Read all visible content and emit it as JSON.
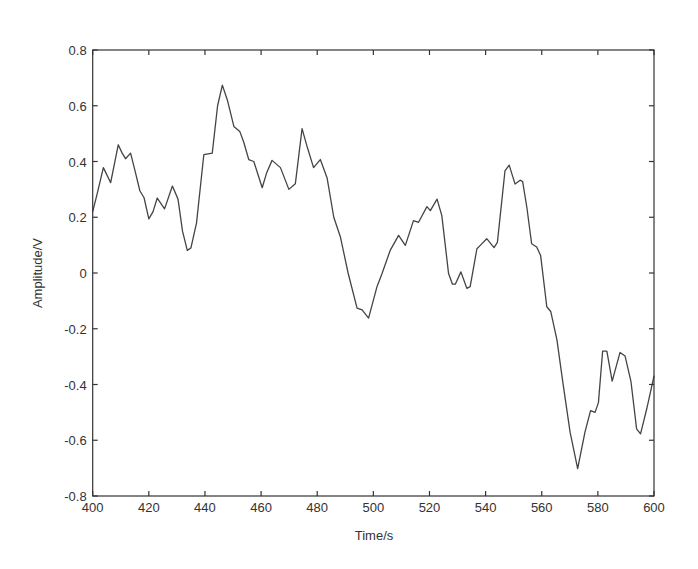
{
  "chart_data": {
    "type": "line",
    "title": "",
    "xlabel": "Time/s",
    "ylabel": "Amplitude/V",
    "xlim": [
      400,
      600
    ],
    "ylim": [
      -0.8,
      0.8
    ],
    "xticks": [
      400,
      420,
      440,
      460,
      480,
      500,
      520,
      540,
      560,
      580,
      600
    ],
    "yticks": [
      -0.8,
      -0.6,
      -0.4,
      -0.2,
      0,
      0.2,
      0.4,
      0.6,
      0.8
    ],
    "xtick_labels": [
      "400",
      "420",
      "440",
      "460",
      "480",
      "500",
      "520",
      "540",
      "560",
      "580",
      "600"
    ],
    "ytick_labels": [
      "-0.8",
      "-0.6",
      "-0.4",
      "-0.2",
      "0",
      "0.2",
      "0.4",
      "0.6",
      "0.8"
    ],
    "grid": false,
    "legend": null,
    "series": [
      {
        "name": "signal",
        "color": "#444444",
        "x": [
          400,
          401.5,
          403.8,
          406.4,
          409.1,
          410.5,
          411.7,
          413.5,
          415,
          416.8,
          418.3,
          420,
          421.5,
          423,
          425.6,
          428.4,
          430.4,
          432,
          433.7,
          435,
          437,
          439.6,
          442.6,
          444.5,
          446.2,
          448,
          450.3,
          452.4,
          453.8,
          455.6,
          457.4,
          460.4,
          462,
          463.9,
          466.9,
          469.9,
          472.2,
          474.6,
          476.5,
          478.7,
          481.1,
          483.5,
          485.9,
          488.3,
          491,
          494.2,
          496,
          498.3,
          501.3,
          503.1,
          506,
          509,
          511.4,
          514.3,
          516.1,
          519.1,
          520.3,
          522.7,
          524.4,
          526.8,
          528.2,
          529.2,
          531.2,
          533.3,
          534.5,
          536.9,
          538.1,
          540.4,
          543,
          544.2,
          546.9,
          548.4,
          550.5,
          552.3,
          553.2,
          554.7,
          556.4,
          558.2,
          559.6,
          561.8,
          563.2,
          565.4,
          567.7,
          570.1,
          572.8,
          575.4,
          577.4,
          579,
          580.2,
          581.7,
          583.2,
          585.1,
          587.9,
          589.7,
          591.8,
          593.8,
          595.2,
          597.4,
          600
        ],
        "y": [
          0.22,
          0.28,
          0.378,
          0.324,
          0.46,
          0.43,
          0.41,
          0.43,
          0.37,
          0.295,
          0.27,
          0.194,
          0.22,
          0.269,
          0.23,
          0.312,
          0.265,
          0.15,
          0.081,
          0.09,
          0.18,
          0.425,
          0.43,
          0.6,
          0.674,
          0.62,
          0.526,
          0.508,
          0.47,
          0.407,
          0.4,
          0.306,
          0.36,
          0.404,
          0.378,
          0.3,
          0.32,
          0.518,
          0.45,
          0.378,
          0.407,
          0.342,
          0.2,
          0.128,
          0.0,
          -0.126,
          -0.132,
          -0.162,
          -0.049,
          -0.002,
          0.081,
          0.135,
          0.099,
          0.188,
          0.182,
          0.238,
          0.224,
          0.265,
          0.206,
          -0.002,
          -0.04,
          -0.04,
          0.004,
          -0.055,
          -0.049,
          0.087,
          0.099,
          0.123,
          0.091,
          0.11,
          0.366,
          0.387,
          0.319,
          0.333,
          0.328,
          0.235,
          0.105,
          0.093,
          0.063,
          -0.121,
          -0.138,
          -0.239,
          -0.405,
          -0.571,
          -0.702,
          -0.571,
          -0.494,
          -0.5,
          -0.465,
          -0.28,
          -0.28,
          -0.388,
          -0.285,
          -0.298,
          -0.39,
          -0.559,
          -0.577,
          -0.488,
          -0.37
        ]
      }
    ]
  }
}
